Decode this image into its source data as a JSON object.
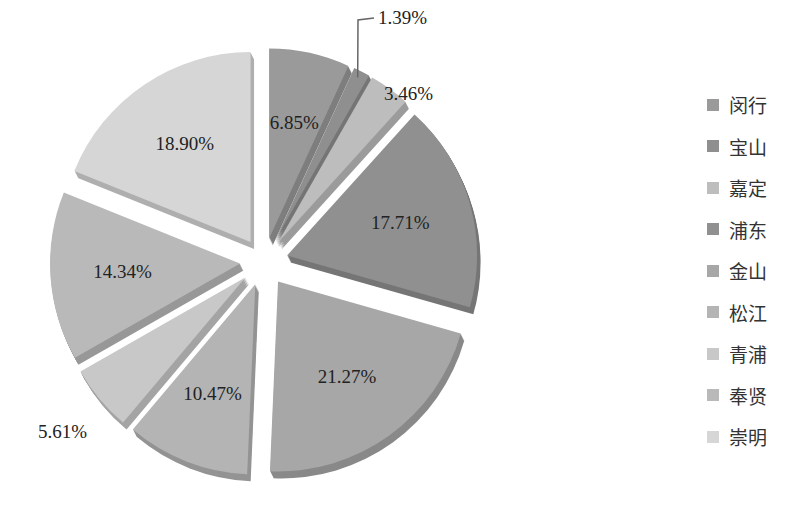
{
  "chart_data": {
    "type": "pie",
    "title": "",
    "exploded": true,
    "three_d": true,
    "start_angle_deg": 0,
    "direction": "clockwise",
    "categories": [
      "闵行",
      "宝山",
      "嘉定",
      "浦东",
      "金山",
      "松江",
      "青浦",
      "奉贤",
      "崇明"
    ],
    "values": [
      6.85,
      1.39,
      3.46,
      17.71,
      21.27,
      10.47,
      5.61,
      14.34,
      18.9
    ],
    "labels": [
      "6.85%",
      "1.39%",
      "3.46%",
      "17.71%",
      "21.27%",
      "10.47%",
      "5.61%",
      "14.34%",
      "18.90%"
    ],
    "colors": [
      "#9a9a9a",
      "#8f8f8f",
      "#bdbdbd",
      "#909090",
      "#a7a7a7",
      "#b4b4b4",
      "#c8c8c8",
      "#b9b9b9",
      "#d6d6d6"
    ],
    "legend_position": "right"
  },
  "legend": {
    "items": [
      {
        "label": "闵行",
        "color": "#9a9a9a"
      },
      {
        "label": "宝山",
        "color": "#8f8f8f"
      },
      {
        "label": "嘉定",
        "color": "#bdbdbd"
      },
      {
        "label": "浦东",
        "color": "#909090"
      },
      {
        "label": "金山",
        "color": "#a7a7a7"
      },
      {
        "label": "松江",
        "color": "#b4b4b4"
      },
      {
        "label": "青浦",
        "color": "#c8c8c8"
      },
      {
        "label": "奉贤",
        "color": "#b9b9b9"
      },
      {
        "label": "崇明",
        "color": "#d6d6d6"
      }
    ]
  }
}
